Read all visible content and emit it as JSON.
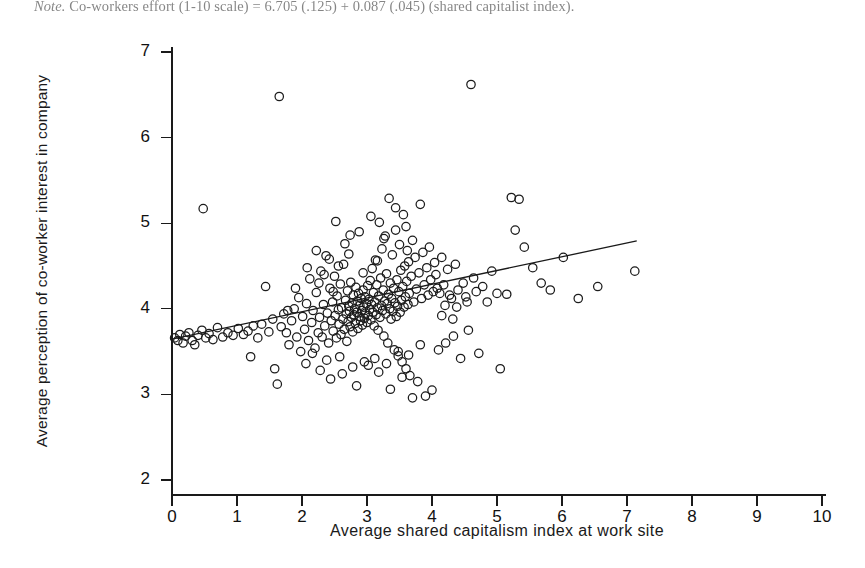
{
  "figure": {
    "note_prefix": "Note.",
    "note_text": " Co-workers effort (1-10 scale) = 6.705 (.125) + 0.087 (.045) (shared capitalist index).",
    "background_color": "#ffffff",
    "marker_color": "#1c1c1c",
    "line_color": "#1a1a1a"
  },
  "chart_data": {
    "type": "scatter",
    "title": "",
    "xlabel": "Average shared capitalism index at work site",
    "ylabel": "Average perception of co-worker interest in company",
    "xlim": [
      0,
      10
    ],
    "ylim": [
      2,
      7
    ],
    "xticks": [
      0,
      1,
      2,
      3,
      4,
      5,
      6,
      7,
      8,
      9,
      10
    ],
    "yticks": [
      2,
      3,
      4,
      5,
      6,
      7
    ],
    "xtick_labels": [
      "0",
      "1",
      "2",
      "3",
      "4",
      "5",
      "6",
      "7",
      "8",
      "9",
      "10"
    ],
    "ytick_labels": [
      "2",
      "3",
      "4",
      "5",
      "6",
      "7"
    ],
    "grid": false,
    "legend": "none",
    "marker_style": "open-circle",
    "marker_radius_px": 4.2,
    "fit_line": {
      "label": "linear fit",
      "intercept": 3.645,
      "slope": 0.1605,
      "x_start": 0.0,
      "x_end": 7.15
    },
    "annotations": [],
    "points": [
      [
        0.04,
        3.66
      ],
      [
        0.09,
        3.63
      ],
      [
        0.12,
        3.7
      ],
      [
        0.17,
        3.6
      ],
      [
        0.21,
        3.68
      ],
      [
        0.26,
        3.72
      ],
      [
        0.31,
        3.63
      ],
      [
        0.35,
        3.58
      ],
      [
        0.4,
        3.69
      ],
      [
        0.46,
        3.75
      ],
      [
        0.48,
        5.17
      ],
      [
        0.52,
        3.66
      ],
      [
        0.57,
        3.71
      ],
      [
        0.63,
        3.64
      ],
      [
        0.7,
        3.78
      ],
      [
        0.78,
        3.67
      ],
      [
        0.86,
        3.72
      ],
      [
        0.94,
        3.69
      ],
      [
        1.02,
        3.77
      ],
      [
        1.1,
        3.7
      ],
      [
        1.17,
        3.74
      ],
      [
        1.21,
        3.44
      ],
      [
        1.25,
        3.8
      ],
      [
        1.32,
        3.66
      ],
      [
        1.38,
        3.82
      ],
      [
        1.44,
        4.26
      ],
      [
        1.49,
        3.73
      ],
      [
        1.55,
        3.88
      ],
      [
        1.58,
        3.3
      ],
      [
        1.62,
        3.12
      ],
      [
        1.65,
        6.48
      ],
      [
        1.68,
        3.79
      ],
      [
        1.72,
        3.94
      ],
      [
        1.76,
        3.72
      ],
      [
        1.8,
        3.58
      ],
      [
        1.84,
        3.86
      ],
      [
        1.88,
        4.0
      ],
      [
        1.92,
        3.67
      ],
      [
        1.95,
        4.13
      ],
      [
        1.98,
        3.5
      ],
      [
        2.01,
        3.91
      ],
      [
        2.04,
        3.76
      ],
      [
        2.07,
        4.06
      ],
      [
        2.1,
        3.63
      ],
      [
        2.12,
        4.35
      ],
      [
        2.15,
        3.84
      ],
      [
        2.17,
        3.98
      ],
      [
        2.2,
        3.54
      ],
      [
        2.22,
        4.19
      ],
      [
        2.25,
        3.72
      ],
      [
        2.27,
        3.9
      ],
      [
        2.29,
        4.44
      ],
      [
        2.31,
        3.67
      ],
      [
        2.33,
        4.05
      ],
      [
        2.35,
        3.8
      ],
      [
        2.37,
        4.62
      ],
      [
        2.39,
        3.95
      ],
      [
        2.41,
        3.6
      ],
      [
        2.43,
        4.24
      ],
      [
        2.45,
        3.86
      ],
      [
        2.47,
        4.08
      ],
      [
        2.48,
        3.74
      ],
      [
        2.5,
        4.38
      ],
      [
        2.51,
        3.92
      ],
      [
        2.53,
        3.66
      ],
      [
        2.54,
        4.15
      ],
      [
        2.56,
        3.99
      ],
      [
        2.57,
        3.82
      ],
      [
        2.59,
        4.29
      ],
      [
        2.6,
        3.7
      ],
      [
        2.61,
        4.01
      ],
      [
        2.63,
        3.88
      ],
      [
        2.64,
        4.52
      ],
      [
        2.65,
        3.76
      ],
      [
        2.67,
        4.1
      ],
      [
        2.68,
        3.94
      ],
      [
        2.69,
        3.62
      ],
      [
        2.7,
        4.21
      ],
      [
        2.71,
        3.85
      ],
      [
        2.72,
        4.03
      ],
      [
        2.73,
        3.97
      ],
      [
        2.74,
        3.79
      ],
      [
        2.75,
        4.31
      ],
      [
        2.76,
        3.9
      ],
      [
        2.77,
        4.07
      ],
      [
        2.78,
        3.73
      ],
      [
        2.79,
        4.16
      ],
      [
        2.8,
        3.93
      ],
      [
        2.81,
        4.0
      ],
      [
        2.82,
        3.83
      ],
      [
        2.83,
        4.25
      ],
      [
        2.84,
        3.96
      ],
      [
        2.85,
        4.09
      ],
      [
        2.86,
        3.77
      ],
      [
        2.87,
        4.18
      ],
      [
        2.88,
        3.91
      ],
      [
        2.89,
        4.04
      ],
      [
        2.9,
        3.86
      ],
      [
        2.91,
        4.12
      ],
      [
        2.92,
        3.98
      ],
      [
        2.93,
        3.81
      ],
      [
        2.94,
        4.22
      ],
      [
        2.95,
        4.02
      ],
      [
        2.96,
        3.89
      ],
      [
        2.97,
        4.14
      ],
      [
        2.98,
        3.95
      ],
      [
        2.99,
        4.06
      ],
      [
        3.0,
        3.84
      ],
      [
        3.01,
        4.27
      ],
      [
        3.02,
        3.92
      ],
      [
        3.03,
        4.11
      ],
      [
        3.04,
        3.99
      ],
      [
        3.05,
        4.33
      ],
      [
        3.06,
        3.87
      ],
      [
        3.07,
        4.05
      ],
      [
        3.08,
        4.47
      ],
      [
        3.09,
        3.96
      ],
      [
        3.1,
        4.19
      ],
      [
        3.11,
        3.8
      ],
      [
        3.12,
        4.08
      ],
      [
        3.13,
        4.57
      ],
      [
        3.14,
        3.93
      ],
      [
        3.15,
        4.28
      ],
      [
        3.16,
        4.01
      ],
      [
        3.17,
        3.75
      ],
      [
        3.18,
        4.15
      ],
      [
        3.19,
        5.01
      ],
      [
        3.2,
        3.9
      ],
      [
        3.21,
        4.36
      ],
      [
        3.22,
        4.04
      ],
      [
        3.23,
        4.7
      ],
      [
        3.24,
        3.98
      ],
      [
        3.25,
        4.22
      ],
      [
        3.26,
        3.68
      ],
      [
        3.27,
        4.09
      ],
      [
        3.28,
        4.85
      ],
      [
        3.29,
        3.94
      ],
      [
        3.3,
        4.41
      ],
      [
        3.31,
        4.06
      ],
      [
        3.32,
        3.6
      ],
      [
        3.33,
        4.17
      ],
      [
        3.34,
        5.29
      ],
      [
        3.35,
        4.0
      ],
      [
        3.36,
        4.3
      ],
      [
        3.37,
        3.88
      ],
      [
        3.38,
        4.12
      ],
      [
        3.39,
        4.63
      ],
      [
        3.4,
        3.97
      ],
      [
        3.41,
        4.24
      ],
      [
        3.42,
        3.52
      ],
      [
        3.43,
        4.07
      ],
      [
        3.44,
        4.92
      ],
      [
        3.45,
        3.91
      ],
      [
        3.46,
        4.34
      ],
      [
        3.47,
        4.03
      ],
      [
        3.48,
        3.45
      ],
      [
        3.49,
        4.2
      ],
      [
        3.5,
        4.75
      ],
      [
        3.51,
        3.96
      ],
      [
        3.52,
        4.45
      ],
      [
        3.53,
        4.1
      ],
      [
        3.54,
        3.38
      ],
      [
        3.55,
        4.26
      ],
      [
        3.56,
        5.1
      ],
      [
        3.57,
        4.02
      ],
      [
        3.58,
        4.5
      ],
      [
        3.59,
        4.14
      ],
      [
        3.6,
        3.3
      ],
      [
        3.61,
        4.32
      ],
      [
        3.62,
        4.68
      ],
      [
        3.63,
        4.05
      ],
      [
        3.64,
        4.55
      ],
      [
        3.65,
        4.18
      ],
      [
        3.66,
        3.22
      ],
      [
        3.68,
        4.38
      ],
      [
        3.7,
        4.8
      ],
      [
        3.72,
        4.08
      ],
      [
        3.74,
        4.6
      ],
      [
        3.76,
        4.23
      ],
      [
        3.78,
        3.15
      ],
      [
        3.8,
        4.42
      ],
      [
        3.82,
        5.22
      ],
      [
        3.84,
        4.12
      ],
      [
        3.86,
        4.66
      ],
      [
        3.88,
        4.28
      ],
      [
        3.9,
        2.98
      ],
      [
        3.92,
        4.48
      ],
      [
        3.94,
        4.16
      ],
      [
        3.96,
        4.72
      ],
      [
        3.98,
        4.34
      ],
      [
        4.0,
        3.05
      ],
      [
        4.02,
        4.2
      ],
      [
        4.04,
        4.54
      ],
      [
        4.06,
        4.4
      ],
      [
        4.08,
        4.24
      ],
      [
        4.1,
        3.52
      ],
      [
        4.12,
        4.18
      ],
      [
        4.15,
        4.6
      ],
      [
        4.18,
        4.28
      ],
      [
        4.21,
        3.6
      ],
      [
        4.24,
        4.46
      ],
      [
        4.27,
        4.16
      ],
      [
        4.3,
        4.12
      ],
      [
        4.33,
        3.68
      ],
      [
        4.36,
        4.52
      ],
      [
        4.4,
        4.22
      ],
      [
        4.44,
        3.42
      ],
      [
        4.48,
        4.3
      ],
      [
        4.52,
        4.14
      ],
      [
        4.56,
        3.75
      ],
      [
        4.6,
        6.62
      ],
      [
        4.64,
        4.36
      ],
      [
        4.68,
        4.2
      ],
      [
        4.72,
        3.48
      ],
      [
        4.78,
        4.26
      ],
      [
        4.85,
        4.08
      ],
      [
        4.92,
        4.44
      ],
      [
        5.0,
        4.18
      ],
      [
        5.05,
        3.3
      ],
      [
        5.15,
        4.17
      ],
      [
        5.22,
        5.3
      ],
      [
        5.28,
        4.92
      ],
      [
        5.34,
        5.28
      ],
      [
        5.42,
        4.72
      ],
      [
        5.55,
        4.48
      ],
      [
        5.68,
        4.3
      ],
      [
        5.82,
        4.22
      ],
      [
        6.02,
        4.6
      ],
      [
        6.25,
        4.12
      ],
      [
        6.55,
        4.26
      ],
      [
        7.12,
        4.44
      ],
      [
        2.06,
        3.36
      ],
      [
        2.28,
        3.28
      ],
      [
        2.44,
        3.18
      ],
      [
        2.62,
        3.24
      ],
      [
        2.84,
        3.1
      ],
      [
        3.02,
        3.34
      ],
      [
        3.18,
        3.26
      ],
      [
        3.36,
        3.06
      ],
      [
        3.54,
        3.2
      ],
      [
        3.7,
        2.96
      ],
      [
        2.16,
        3.48
      ],
      [
        2.38,
        3.4
      ],
      [
        2.58,
        3.44
      ],
      [
        2.78,
        3.32
      ],
      [
        2.96,
        3.38
      ],
      [
        3.12,
        3.42
      ],
      [
        3.3,
        3.36
      ],
      [
        3.48,
        3.5
      ],
      [
        3.64,
        3.46
      ],
      [
        3.82,
        3.58
      ],
      [
        2.22,
        4.68
      ],
      [
        2.42,
        4.58
      ],
      [
        2.66,
        4.76
      ],
      [
        2.88,
        4.9
      ],
      [
        3.06,
        5.08
      ],
      [
        3.26,
        4.82
      ],
      [
        3.44,
        5.18
      ],
      [
        3.6,
        4.96
      ],
      [
        2.52,
        5.02
      ],
      [
        2.74,
        4.86
      ],
      [
        2.34,
        4.4
      ],
      [
        2.56,
        4.5
      ],
      [
        2.72,
        4.64
      ],
      [
        2.94,
        4.42
      ],
      [
        3.16,
        4.56
      ],
      [
        1.9,
        4.24
      ],
      [
        2.08,
        4.48
      ],
      [
        2.26,
        4.3
      ],
      [
        2.48,
        4.2
      ],
      [
        1.78,
        3.98
      ],
      [
        4.2,
        4.04
      ],
      [
        4.38,
        4.02
      ],
      [
        4.54,
        4.08
      ],
      [
        4.15,
        3.92
      ],
      [
        4.32,
        3.88
      ]
    ],
    "n_points": 300
  }
}
